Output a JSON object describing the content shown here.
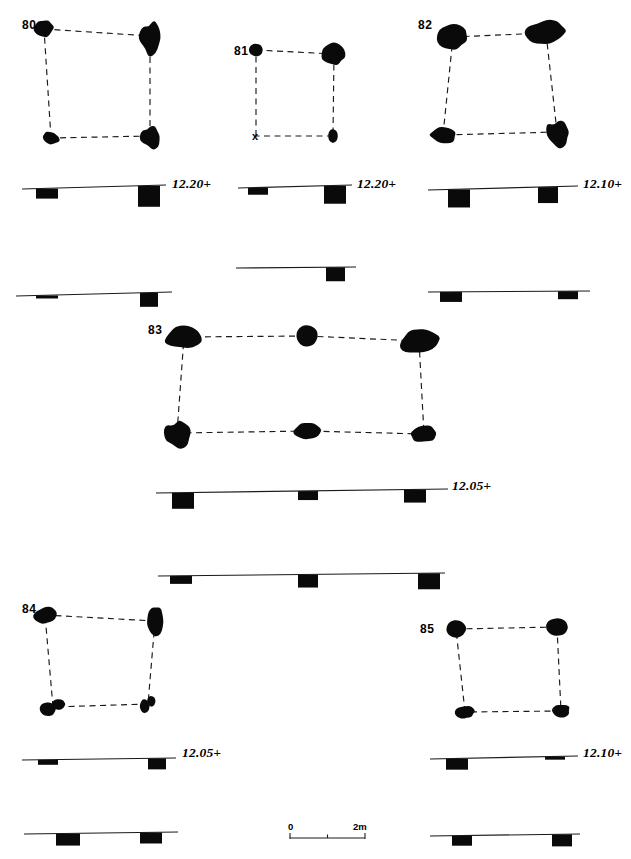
{
  "figure": {
    "kind": "archaeological-plan-and-section-plate",
    "background_color": "#ffffff",
    "ink_color": "#0a0a0a"
  },
  "scale_bar": {
    "name": "scale-bar",
    "start_label": "0",
    "end_label": "2m",
    "x": 290,
    "y": 838,
    "length": 75,
    "ticks": [
      0,
      0.5,
      1.0
    ]
  },
  "structures": [
    {
      "id": "80",
      "label": "80",
      "label_x": 22,
      "label_y": 29,
      "plan": {
        "postholes": [
          {
            "name": "posthole-nw",
            "cx": 44,
            "cy": 29,
            "rx": 9.5,
            "ry": 8.5,
            "rot": -12,
            "shape": "blob"
          },
          {
            "name": "posthole-ne",
            "cx": 150,
            "cy": 36,
            "rx": 11,
            "ry": 15,
            "rot": 8,
            "shape": "lobed"
          },
          {
            "name": "posthole-sw",
            "cx": 51,
            "cy": 138,
            "rx": 8.5,
            "ry": 6.5,
            "rot": 20,
            "shape": "blob"
          },
          {
            "name": "posthole-se",
            "cx": 150,
            "cy": 136,
            "rx": 10,
            "ry": 11,
            "rot": -5,
            "shape": "lobed"
          }
        ],
        "links": [
          [
            0,
            1
          ],
          [
            1,
            3
          ],
          [
            3,
            2
          ],
          [
            2,
            0
          ]
        ]
      },
      "sections": [
        {
          "name": "section-upper",
          "elevation": "12.20+",
          "elev_x": 172,
          "elev_y": 188,
          "ground_x1": 22,
          "ground_y1": 189,
          "ground_x2": 166,
          "ground_y2": 185,
          "posts": [
            {
              "x": 36,
              "w": 22,
              "h": 10
            },
            {
              "x": 138,
              "w": 22,
              "h": 21
            }
          ]
        },
        {
          "name": "section-lower",
          "elevation": "",
          "ground_x1": 16,
          "ground_y1": 296,
          "ground_x2": 172,
          "ground_y2": 292,
          "posts": [
            {
              "x": 36,
              "w": 22,
              "h": 3
            },
            {
              "x": 140,
              "w": 18,
              "h": 14
            }
          ]
        }
      ]
    },
    {
      "id": "81",
      "label": "81",
      "label_x": 234,
      "label_y": 55,
      "plan": {
        "postholes": [
          {
            "name": "posthole-nw",
            "cx": 256,
            "cy": 50,
            "rx": 7,
            "ry": 6.5,
            "rot": 0,
            "shape": "round"
          },
          {
            "name": "posthole-ne",
            "cx": 334,
            "cy": 54,
            "rx": 12,
            "ry": 10.5,
            "rot": -10,
            "shape": "blob"
          },
          {
            "name": "posthole-sw",
            "cx": 256,
            "cy": 136,
            "rx": 0,
            "ry": 0,
            "rot": 0,
            "shape": "x-mark"
          },
          {
            "name": "posthole-se",
            "cx": 333,
            "cy": 136,
            "rx": 5,
            "ry": 7,
            "rot": 0,
            "shape": "round"
          }
        ],
        "links": [
          [
            0,
            1
          ],
          [
            1,
            3
          ],
          [
            3,
            2
          ],
          [
            2,
            0
          ]
        ],
        "x_marker": {
          "name": "x-marker",
          "x": 256,
          "y": 140,
          "label": "x"
        }
      },
      "sections": [
        {
          "name": "section-upper",
          "elevation": "12.20+",
          "elev_x": 357,
          "elev_y": 188,
          "ground_x1": 238,
          "ground_y1": 188,
          "ground_x2": 352,
          "ground_y2": 185,
          "posts": [
            {
              "x": 248,
              "w": 20,
              "h": 7
            },
            {
              "x": 324,
              "w": 22,
              "h": 18
            }
          ]
        },
        {
          "name": "section-lower",
          "elevation": "",
          "ground_x1": 236,
          "ground_y1": 268,
          "ground_x2": 356,
          "ground_y2": 267,
          "posts": [
            {
              "x": 326,
              "w": 19,
              "h": 14
            }
          ]
        }
      ]
    },
    {
      "id": "82",
      "label": "82",
      "label_x": 418,
      "label_y": 29,
      "plan": {
        "postholes": [
          {
            "name": "posthole-nw",
            "cx": 453,
            "cy": 37,
            "rx": 15,
            "ry": 12,
            "rot": -8,
            "shape": "blob"
          },
          {
            "name": "posthole-ne",
            "cx": 546,
            "cy": 33,
            "rx": 20,
            "ry": 12,
            "rot": -8,
            "shape": "blob"
          },
          {
            "name": "posthole-sw",
            "cx": 443,
            "cy": 135,
            "rx": 13,
            "ry": 7.5,
            "rot": 8,
            "shape": "blob"
          },
          {
            "name": "posthole-se",
            "cx": 557,
            "cy": 132,
            "rx": 12,
            "ry": 12,
            "rot": 0,
            "shape": "lobed"
          }
        ],
        "links": [
          [
            0,
            1
          ],
          [
            1,
            3
          ],
          [
            3,
            2
          ],
          [
            2,
            0
          ]
        ]
      },
      "sections": [
        {
          "name": "section-upper",
          "elevation": "12.10+",
          "elev_x": 583,
          "elev_y": 188,
          "ground_x1": 428,
          "ground_y1": 190,
          "ground_x2": 578,
          "ground_y2": 186,
          "posts": [
            {
              "x": 448,
              "w": 22,
              "h": 18
            },
            {
              "x": 538,
              "w": 20,
              "h": 16
            }
          ]
        },
        {
          "name": "section-lower",
          "elevation": "",
          "ground_x1": 428,
          "ground_y1": 292,
          "ground_x2": 590,
          "ground_y2": 291,
          "posts": [
            {
              "x": 440,
              "w": 22,
              "h": 10
            },
            {
              "x": 558,
              "w": 20,
              "h": 8
            }
          ]
        }
      ]
    },
    {
      "id": "83",
      "label": "83",
      "label_x": 148,
      "label_y": 334,
      "plan": {
        "postholes": [
          {
            "name": "posthole-nw",
            "cx": 184,
            "cy": 337,
            "rx": 19,
            "ry": 11,
            "rot": -7,
            "shape": "blob"
          },
          {
            "name": "posthole-n-mid",
            "cx": 307,
            "cy": 336,
            "rx": 11,
            "ry": 11,
            "rot": 0,
            "shape": "round"
          },
          {
            "name": "posthole-ne",
            "cx": 419,
            "cy": 341,
            "rx": 19,
            "ry": 11.5,
            "rot": -12,
            "shape": "blob"
          },
          {
            "name": "posthole-sw",
            "cx": 177,
            "cy": 433,
            "rx": 14,
            "ry": 12,
            "rot": 0,
            "shape": "lobed"
          },
          {
            "name": "posthole-s-mid",
            "cx": 307,
            "cy": 431,
            "rx": 13,
            "ry": 8,
            "rot": -6,
            "shape": "blob"
          },
          {
            "name": "posthole-se",
            "cx": 424,
            "cy": 434,
            "rx": 13,
            "ry": 8.5,
            "rot": -6,
            "shape": "blob"
          }
        ],
        "links": [
          [
            0,
            1
          ],
          [
            1,
            2
          ],
          [
            2,
            5
          ],
          [
            5,
            4
          ],
          [
            4,
            3
          ],
          [
            3,
            0
          ]
        ]
      },
      "sections": [
        {
          "name": "section-upper",
          "elevation": "12.05+",
          "elev_x": 452,
          "elev_y": 490,
          "ground_x1": 156,
          "ground_y1": 493,
          "ground_x2": 448,
          "ground_y2": 489,
          "posts": [
            {
              "x": 172,
              "w": 22,
              "h": 16
            },
            {
              "x": 298,
              "w": 20,
              "h": 9
            },
            {
              "x": 404,
              "w": 22,
              "h": 13
            }
          ]
        },
        {
          "name": "section-lower",
          "elevation": "",
          "ground_x1": 158,
          "ground_y1": 576,
          "ground_x2": 445,
          "ground_y2": 573,
          "posts": [
            {
              "x": 170,
              "w": 22,
              "h": 8
            },
            {
              "x": 298,
              "w": 20,
              "h": 13
            },
            {
              "x": 418,
              "w": 22,
              "h": 16
            }
          ]
        }
      ]
    },
    {
      "id": "84",
      "label": "84",
      "label_x": 22,
      "label_y": 613,
      "plan": {
        "postholes": [
          {
            "name": "posthole-nw",
            "cx": 45,
            "cy": 615,
            "rx": 11,
            "ry": 8,
            "rot": -12,
            "shape": "blob"
          },
          {
            "name": "posthole-ne",
            "cx": 155,
            "cy": 621,
            "rx": 9,
            "ry": 14,
            "rot": 0,
            "shape": "blob"
          },
          {
            "name": "posthole-sw",
            "cx": 53,
            "cy": 707,
            "rx": 13,
            "ry": 9,
            "rot": 0,
            "shape": "double"
          },
          {
            "name": "posthole-se",
            "cx": 148,
            "cy": 704,
            "rx": 8,
            "ry": 9,
            "rot": 0,
            "shape": "double"
          }
        ],
        "links": [
          [
            0,
            1
          ],
          [
            1,
            3
          ],
          [
            3,
            2
          ],
          [
            2,
            0
          ]
        ]
      },
      "sections": [
        {
          "name": "section-upper",
          "elevation": "12.05+",
          "elev_x": 182,
          "elev_y": 757,
          "ground_x1": 22,
          "ground_y1": 760,
          "ground_x2": 176,
          "ground_y2": 758,
          "posts": [
            {
              "x": 38,
              "w": 20,
              "h": 5
            },
            {
              "x": 148,
              "w": 18,
              "h": 11
            }
          ]
        },
        {
          "name": "section-lower",
          "elevation": "",
          "ground_x1": 24,
          "ground_y1": 834,
          "ground_x2": 178,
          "ground_y2": 832,
          "posts": [
            {
              "x": 56,
              "w": 24,
              "h": 12
            },
            {
              "x": 140,
              "w": 22,
              "h": 11
            }
          ]
        }
      ]
    },
    {
      "id": "85",
      "label": "85",
      "label_x": 420,
      "label_y": 633,
      "plan": {
        "postholes": [
          {
            "name": "posthole-nw",
            "cx": 456,
            "cy": 629,
            "rx": 10,
            "ry": 9,
            "rot": 0,
            "shape": "round"
          },
          {
            "name": "posthole-ne",
            "cx": 557,
            "cy": 627,
            "rx": 11,
            "ry": 9,
            "rot": 0,
            "shape": "round"
          },
          {
            "name": "posthole-sw",
            "cx": 465,
            "cy": 712,
            "rx": 10,
            "ry": 6.5,
            "rot": -6,
            "shape": "blob"
          },
          {
            "name": "posthole-se",
            "cx": 561,
            "cy": 711,
            "rx": 9,
            "ry": 6.5,
            "rot": -6,
            "shape": "blob"
          }
        ],
        "links": [
          [
            0,
            1
          ],
          [
            1,
            3
          ],
          [
            3,
            2
          ],
          [
            2,
            0
          ]
        ]
      },
      "sections": [
        {
          "name": "section-upper",
          "elevation": "12.10+",
          "elev_x": 583,
          "elev_y": 757,
          "ground_x1": 430,
          "ground_y1": 759,
          "ground_x2": 578,
          "ground_y2": 756,
          "posts": [
            {
              "x": 446,
              "w": 22,
              "h": 11
            },
            {
              "x": 545,
              "w": 20,
              "h": 3
            }
          ]
        },
        {
          "name": "section-lower",
          "elevation": "",
          "ground_x1": 430,
          "ground_y1": 836,
          "ground_x2": 580,
          "ground_y2": 834,
          "posts": [
            {
              "x": 452,
              "w": 20,
              "h": 10
            },
            {
              "x": 552,
              "w": 20,
              "h": 12
            }
          ]
        }
      ]
    }
  ]
}
